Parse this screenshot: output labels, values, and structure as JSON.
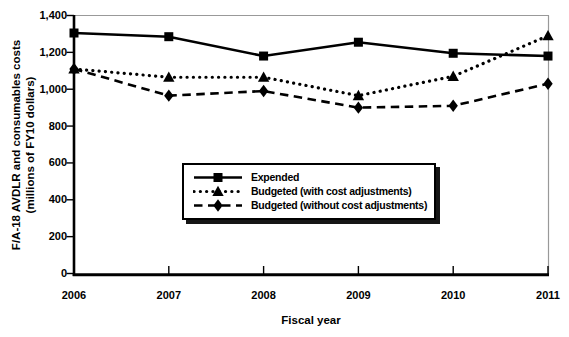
{
  "figure": {
    "background": "#ffffff",
    "ink_color": "#000000",
    "frame_color": "#999999",
    "legend_shadow_color": "#161616"
  },
  "chart_data": {
    "type": "line",
    "title": "",
    "xlabel": "Fiscal year",
    "ylabel_line1": "F/A-18 AVDLR and consumables costs",
    "ylabel_line2": "(millions of FY10 dollars)",
    "x": [
      2006,
      2007,
      2008,
      2009,
      2010,
      2011
    ],
    "xlim": [
      2006,
      2011
    ],
    "ylim": [
      0,
      1400
    ],
    "y_ticks": [
      0,
      200,
      400,
      600,
      800,
      1000,
      1200,
      1400
    ],
    "grid": false,
    "legend_position": "inside lower-center",
    "series": [
      {
        "name": "Expended",
        "marker": "square",
        "line_style": "solid",
        "color": "#000000",
        "values": [
          1305,
          1285,
          1180,
          1255,
          1195,
          1180
        ]
      },
      {
        "name": "Budgeted (with cost adjustments)",
        "marker": "triangle",
        "line_style": "dotted",
        "color": "#000000",
        "values": [
          1110,
          1065,
          1065,
          965,
          1070,
          1290
        ]
      },
      {
        "name": "Budgeted (without cost adjustments)",
        "marker": "diamond",
        "line_style": "dashed",
        "color": "#000000",
        "values": [
          1110,
          965,
          990,
          900,
          910,
          1030
        ]
      }
    ]
  }
}
